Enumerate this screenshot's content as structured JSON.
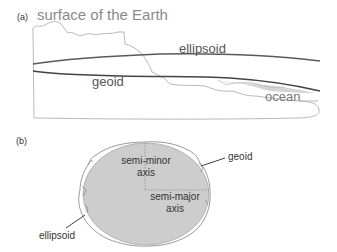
{
  "panel_a": {
    "tag": "(a)",
    "labels": {
      "surface": "surface of the Earth",
      "ellipsoid": "ellipsoid",
      "geoid": "geoid",
      "ocean": "ocean"
    },
    "colors": {
      "surface_line": "#b0b0b0",
      "ellipsoid_line": "#555555",
      "geoid_line": "#444444",
      "ocean_fill": "#d4d4d4"
    }
  },
  "panel_b": {
    "tag": "(b)",
    "labels": {
      "semi_minor_1": "semi-minor",
      "semi_minor_2": "axis",
      "semi_major_1": "semi-major",
      "semi_major_2": "axis",
      "geoid": "geoid",
      "ellipsoid": "ellipsoid"
    },
    "colors": {
      "ellipse_fill": "#cdcdcd",
      "outline": "#999999",
      "axis_dash": "#8a8a8a"
    }
  }
}
